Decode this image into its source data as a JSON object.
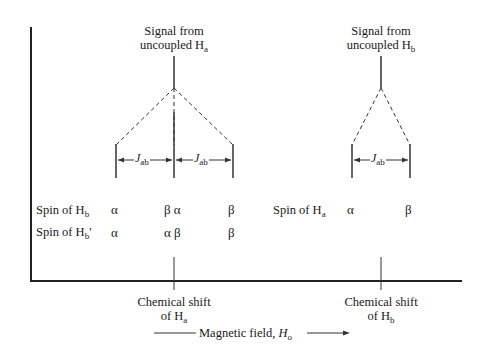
{
  "diagram": {
    "title_a": {
      "line1": "Signal from",
      "line2": "uncoupled H",
      "sub": "a"
    },
    "title_b": {
      "line1": "Signal from",
      "line2": "uncoupled H",
      "sub": "b"
    },
    "coupling_label": {
      "J": "J",
      "sub": "ab"
    },
    "rows": {
      "left_row1": {
        "label": "Spin of H",
        "sub": "b",
        "prime": ""
      },
      "left_row2": {
        "label": "Spin of H",
        "sub": "b",
        "prime": "'"
      },
      "right_row1": {
        "label": "Spin of H",
        "sub": "a"
      }
    },
    "spins": {
      "row1_left": [
        "α",
        "β α",
        "β"
      ],
      "row2_left": [
        "α",
        "α β",
        "β"
      ],
      "row1_right": [
        "α",
        "β"
      ]
    },
    "shift_a": {
      "line1": "Chemical shift",
      "line2": "of H",
      "sub": "a"
    },
    "shift_b": {
      "line1": "Chemical shift",
      "line2": "of H",
      "sub": "b"
    },
    "field_label": {
      "text": "Magnetic field, ",
      "H": "H",
      "sub": "o"
    },
    "colors": {
      "ink": "#1a1a1a",
      "background": "#ffffff"
    }
  }
}
